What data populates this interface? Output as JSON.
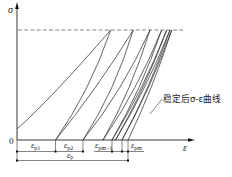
{
  "figure": {
    "axes": {
      "y_label": "σ",
      "x_label": "ε",
      "origin_label": "0"
    },
    "curve_label": "稳定后σ-ε曲线",
    "dimensions": {
      "ep1": {
        "symbol": "ε",
        "sub": "p1"
      },
      "ep2": {
        "symbol": "ε",
        "sub": "p2"
      },
      "epm_1": {
        "symbol": "ε",
        "sub": "pm−1"
      },
      "epm": {
        "symbol": "ε",
        "sub": "pm"
      },
      "ep": {
        "symbol": "ε",
        "sub": "p"
      }
    }
  },
  "colors": {
    "line": "#333333",
    "background": "#ffffff"
  }
}
